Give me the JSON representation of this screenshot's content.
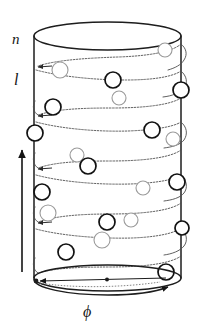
{
  "figure": {
    "kind": "cylinder-helix-diagram",
    "background_color": "#ffffff",
    "ink_color": "#151515",
    "helix_color": "#555555",
    "bead_front_color": "#111111",
    "bead_back_color": "#9a9a9a",
    "bead_fill": "#ffffff"
  },
  "labels": {
    "axial": "n",
    "helix": "l",
    "angular": "ϕ"
  },
  "axes": {
    "vertical_arrow": {
      "name": "axial-direction-arrow",
      "direction": "up",
      "x": 22,
      "y_start": 272,
      "y_end": 148
    },
    "azimuthal_arrow": {
      "name": "azimuthal-direction-arrow",
      "direction": "clockwise-around-base",
      "label": "ϕ"
    }
  },
  "cylinder": {
    "left": 34,
    "right": 181,
    "top": 22,
    "bottom": 278,
    "rim_ry": 14,
    "base_ry": 13
  },
  "helix": {
    "turns": 9,
    "start_y": 38,
    "pitch": 27,
    "amplitude": 11,
    "line_style": "dotted-textured",
    "stroke_width": 0.9
  },
  "beads": [
    {
      "cx": 165,
      "cy": 50,
      "r": 7,
      "layer": "back"
    },
    {
      "cx": 60,
      "cy": 70,
      "r": 8,
      "layer": "back"
    },
    {
      "cx": 113,
      "cy": 80,
      "r": 8,
      "layer": "front"
    },
    {
      "cx": 181,
      "cy": 90,
      "r": 8,
      "layer": "front"
    },
    {
      "cx": 119,
      "cy": 98,
      "r": 7,
      "layer": "back"
    },
    {
      "cx": 53,
      "cy": 107,
      "r": 8,
      "layer": "front"
    },
    {
      "cx": 35,
      "cy": 133,
      "r": 8,
      "layer": "front"
    },
    {
      "cx": 152,
      "cy": 130,
      "r": 8,
      "layer": "front"
    },
    {
      "cx": 173,
      "cy": 139,
      "r": 7,
      "layer": "back"
    },
    {
      "cx": 77,
      "cy": 155,
      "r": 7,
      "layer": "back"
    },
    {
      "cx": 88,
      "cy": 166,
      "r": 8,
      "layer": "front"
    },
    {
      "cx": 177,
      "cy": 182,
      "r": 8,
      "layer": "front"
    },
    {
      "cx": 143,
      "cy": 188,
      "r": 7,
      "layer": "back"
    },
    {
      "cx": 42,
      "cy": 192,
      "r": 8,
      "layer": "front"
    },
    {
      "cx": 48,
      "cy": 213,
      "r": 8,
      "layer": "back"
    },
    {
      "cx": 107,
      "cy": 222,
      "r": 8,
      "layer": "front"
    },
    {
      "cx": 182,
      "cy": 228,
      "r": 7,
      "layer": "front"
    },
    {
      "cx": 131,
      "cy": 220,
      "r": 7,
      "layer": "back"
    },
    {
      "cx": 102,
      "cy": 240,
      "r": 8,
      "layer": "back"
    },
    {
      "cx": 66,
      "cy": 252,
      "r": 8,
      "layer": "front"
    },
    {
      "cx": 166,
      "cy": 272,
      "r": 8,
      "layer": "front"
    }
  ]
}
